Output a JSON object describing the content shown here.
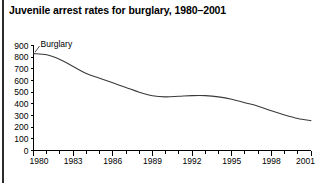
{
  "figure": {
    "title": "Juvenile arrest rates for burglary, 1980–2001",
    "series_label": "Burglary"
  },
  "chart_data": {
    "type": "line",
    "title": "Juvenile arrest rates for burglary, 1980–2001",
    "xlabel": "",
    "ylabel": "",
    "xlim": [
      1980,
      2001
    ],
    "ylim": [
      0,
      900
    ],
    "grid": false,
    "legend": "inline-label",
    "legend_position": "near-series-start",
    "ytick_labels": [
      "0",
      "100",
      "200",
      "300",
      "400",
      "500",
      "600",
      "700",
      "800",
      "900"
    ],
    "yticks": [
      0,
      100,
      200,
      300,
      400,
      500,
      600,
      700,
      800,
      900
    ],
    "xtick_labels": [
      "1980",
      "1983",
      "1986",
      "1989",
      "1992",
      "1995",
      "1998",
      "2001"
    ],
    "xticks_major": [
      1980,
      1983,
      1986,
      1989,
      1992,
      1995,
      1998,
      2001
    ],
    "xticks_minor": [
      1981,
      1982,
      1984,
      1985,
      1987,
      1988,
      1990,
      1991,
      1993,
      1994,
      1996,
      1997,
      1999,
      2000
    ],
    "x": [
      1980,
      1981,
      1982,
      1983,
      1984,
      1985,
      1986,
      1987,
      1988,
      1989,
      1990,
      1991,
      1992,
      1993,
      1994,
      1995,
      1996,
      1997,
      1998,
      1999,
      2000,
      2001
    ],
    "series": [
      {
        "name": "Burglary",
        "values": [
          830,
          820,
          780,
          720,
          660,
          620,
          580,
          540,
          500,
          470,
          460,
          465,
          470,
          470,
          460,
          440,
          410,
          380,
          340,
          305,
          275,
          255
        ]
      }
    ]
  }
}
